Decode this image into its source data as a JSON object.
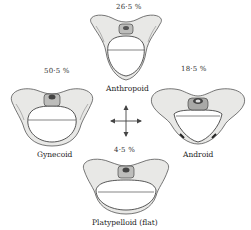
{
  "figure": {
    "types": [
      {
        "key": "anthropoid",
        "label": "Anthropoid",
        "percentage": "26·5 %"
      },
      {
        "key": "gynecoid",
        "label": "Gynecoid",
        "percentage": "50·5 %"
      },
      {
        "key": "android",
        "label": "Android",
        "percentage": "18·5 %"
      },
      {
        "key": "platypelloid",
        "label": "Platypelloid  (flat)",
        "percentage": "4·5 %"
      }
    ],
    "center_icon": "four-direction-arrows-icon"
  }
}
